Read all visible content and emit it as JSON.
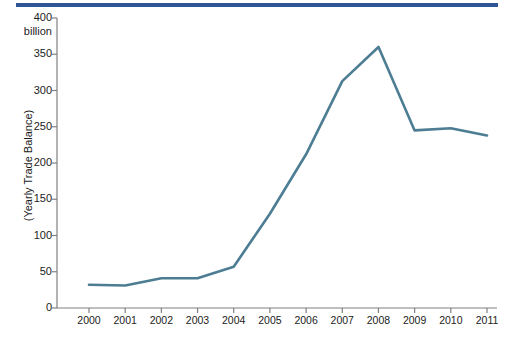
{
  "figure": {
    "top_rule_color": "#2f5597",
    "line_color": "#4d7d93",
    "axis_color": "#808080",
    "background": "#ffffff"
  },
  "axis": {
    "y_unit_label": "billion",
    "y_title": "(Yearly Trade Balance)",
    "y_ticks": [
      "0",
      "50",
      "100",
      "150",
      "200",
      "250",
      "300",
      "350",
      "400"
    ],
    "x_ticks": [
      "2000",
      "2001",
      "2002",
      "2003",
      "2004",
      "2005",
      "2006",
      "2007",
      "2008",
      "2009",
      "2010",
      "2011"
    ]
  },
  "caption": {
    "text": ""
  },
  "chart_data": {
    "type": "line",
    "title": "",
    "subtitle": "",
    "xlabel": "",
    "ylabel": "(Yearly Trade Balance)",
    "y_unit": "billion",
    "xlim": [
      2000,
      2011
    ],
    "ylim": [
      0,
      400
    ],
    "ytick_step": 50,
    "grid": false,
    "legend": false,
    "legend_position": "none",
    "x": [
      2000,
      2001,
      2002,
      2003,
      2004,
      2005,
      2006,
      2007,
      2008,
      2009,
      2010,
      2011
    ],
    "categories": [
      "2000",
      "2001",
      "2002",
      "2003",
      "2004",
      "2005",
      "2006",
      "2007",
      "2008",
      "2009",
      "2010",
      "2011"
    ],
    "series": [
      {
        "name": "Yearly Trade Balance",
        "color": "#4d7d93",
        "values": [
          32,
          31,
          41,
          41,
          57,
          130,
          212,
          313,
          360,
          245,
          248,
          238
        ]
      }
    ]
  }
}
